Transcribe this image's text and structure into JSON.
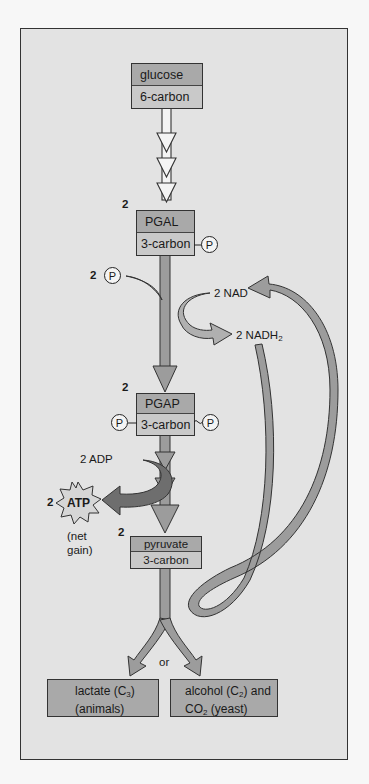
{
  "diagram": {
    "type": "glycolysis-fermentation-pathway",
    "nodes": {
      "glucose": {
        "name": "glucose",
        "carbons": "6-carbon"
      },
      "pgal": {
        "count": "2",
        "name": "PGAL",
        "carbons": "3-carbon",
        "phosphate": "P"
      },
      "pgap": {
        "count": "2",
        "name": "PGAP",
        "carbons": "3-carbon",
        "phosphate_left": "P",
        "phosphate_right": "P"
      },
      "pyruvate": {
        "count": "2",
        "name": "pyruvate",
        "carbons": "3-carbon"
      },
      "lactate": {
        "line1": "lactate (C",
        "line1_sub": "3",
        "line1_end": ")",
        "line2": "(animals)"
      },
      "alcohol": {
        "line1": "alcohol (C",
        "line1_sub": "2",
        "line1_end": ") and",
        "line2": "CO",
        "line2_sub": "2",
        "line2_end": " (yeast)"
      }
    },
    "labels": {
      "phosphate_input_count": "2",
      "phosphate_input": "P",
      "nad": "2 NAD",
      "nadh2": "2 NADH",
      "nadh2_sub": "2",
      "adp": "2 ADP",
      "atp_count": "2",
      "atp": "ATP",
      "net_gain_line1": "(net",
      "net_gain_line2": "gain)",
      "or": "or"
    },
    "colors": {
      "background": "#e3e3e3",
      "box_top": "#a9a9a9",
      "box_bottom": "#c9c9c9",
      "arrow": "#9c9c9c",
      "arrow_dark": "#6e6e6e",
      "outline": "#333333"
    }
  }
}
